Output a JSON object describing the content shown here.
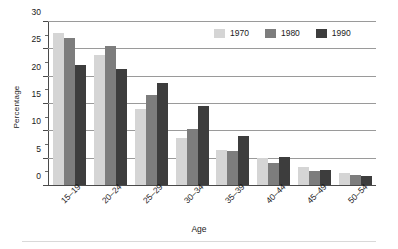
{
  "chart_data": {
    "type": "bar",
    "title": "",
    "xlabel": "Age",
    "ylabel": "Percentage",
    "categories": [
      "15–19",
      "20–24",
      "25–29",
      "30–34",
      "35–39",
      "40–44",
      "45–49",
      "50–54"
    ],
    "series": [
      {
        "name": "1970",
        "color": "#d5d5d5",
        "values": [
          27.9,
          24.0,
          14.0,
          8.7,
          6.4,
          5.0,
          3.3,
          2.2
        ]
      },
      {
        "name": "1980",
        "color": "#7d7d7d",
        "values": [
          27.0,
          25.5,
          16.6,
          10.4,
          6.2,
          4.0,
          2.6,
          1.9
        ]
      },
      {
        "name": "1990",
        "color": "#3d3d3d",
        "values": [
          22.0,
          21.3,
          18.8,
          14.5,
          9.0,
          5.1,
          2.8,
          1.6
        ]
      }
    ],
    "ylim": [
      0,
      30
    ],
    "ytick_labels": [
      "0",
      "5",
      "10",
      "15",
      "20",
      "25",
      "30"
    ],
    "ytick_values": [
      0,
      5,
      10,
      15,
      20,
      25,
      30
    ],
    "yminor_values": [
      2.5,
      7.5,
      12.5,
      17.5,
      22.5,
      27.5
    ],
    "grid": "horizontal",
    "legend_position": "top-right",
    "legend_entries": [
      "1970",
      "1980",
      "1990"
    ]
  }
}
